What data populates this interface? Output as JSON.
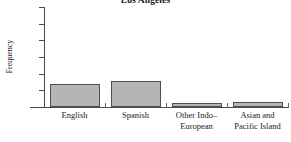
{
  "chart_data": {
    "type": "bar",
    "title": "Los Angeles",
    "xlabel": "",
    "ylabel": "Frequency",
    "categories": [
      "English",
      "Spanish",
      "Other Indo–European",
      "Asian and Pacific Island"
    ],
    "category_lines": [
      [
        "English"
      ],
      [
        "Spanish"
      ],
      [
        "Other Indo–",
        "European"
      ],
      [
        "Asian and",
        "Pacific Island"
      ]
    ],
    "values": [
      1400,
      1550,
      250,
      300
    ],
    "ylim": [
      0,
      6000
    ],
    "yticks": [
      0,
      1000,
      2000,
      3000,
      4000,
      5000,
      6000
    ],
    "ytick_labels": [
      "0",
      "1000",
      "2000",
      "3000",
      "4000",
      "5000",
      "6000"
    ],
    "grid": false,
    "legend": null,
    "bar_fill_color": "#b5b5b5",
    "bar_edge_color": "#4f4f4f",
    "axis_color": "#4a4a4a",
    "background_color": "#ffffff"
  }
}
